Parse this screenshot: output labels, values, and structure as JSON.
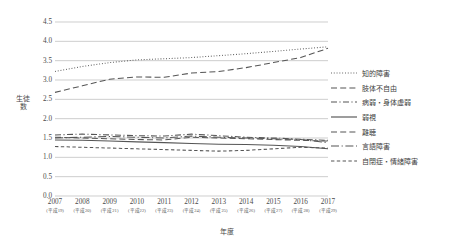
{
  "chart_data": {
    "type": "line",
    "title": "",
    "xlabel": "年度",
    "ylabel": "生徒数",
    "ylim": [
      0.0,
      4.5
    ],
    "ytick_step": 0.5,
    "grid": true,
    "legend_position": "right",
    "categories": [
      "2007",
      "2008",
      "2009",
      "2010",
      "2011",
      "2012",
      "2013",
      "2014",
      "2015",
      "2016",
      "2017"
    ],
    "category_sub": [
      "(平成19)",
      "(平成20)",
      "(平成21)",
      "(平成22)",
      "(平成23)",
      "(平成24)",
      "(平成25)",
      "(平成26)",
      "(平成27)",
      "(平成28)",
      "(平成29)"
    ],
    "yticks": [
      "0.0",
      "0.5",
      "1.0",
      "1.5",
      "2.0",
      "2.5",
      "3.0",
      "3.5",
      "4.0",
      "4.5"
    ],
    "series": [
      {
        "name": "知的障害",
        "dash": "dotted",
        "values": [
          3.22,
          3.35,
          3.45,
          3.52,
          3.55,
          3.58,
          3.63,
          3.68,
          3.74,
          3.8,
          3.86
        ]
      },
      {
        "name": "肢体不自由",
        "dash": "dashed",
        "values": [
          2.68,
          2.85,
          3.02,
          3.08,
          3.07,
          3.18,
          3.22,
          3.32,
          3.45,
          3.58,
          3.82
        ]
      },
      {
        "name": "病弱・身体虚弱",
        "dash": "dashdot",
        "values": [
          1.58,
          1.6,
          1.58,
          1.56,
          1.55,
          1.6,
          1.56,
          1.52,
          1.5,
          1.47,
          1.44
        ]
      },
      {
        "name": "弱視",
        "dash": "solid",
        "values": [
          1.45,
          1.44,
          1.42,
          1.4,
          1.38,
          1.36,
          1.34,
          1.33,
          1.31,
          1.28,
          1.22
        ]
      },
      {
        "name": "難聴",
        "dash": "dashed",
        "values": [
          1.52,
          1.5,
          1.48,
          1.46,
          1.45,
          1.52,
          1.5,
          1.48,
          1.46,
          1.44,
          1.42
        ]
      },
      {
        "name": "言語障害",
        "dash": "longdashdot",
        "values": [
          1.5,
          1.52,
          1.54,
          1.52,
          1.5,
          1.55,
          1.52,
          1.5,
          1.48,
          1.46,
          1.38
        ]
      },
      {
        "name": "自閉症・情緒障害",
        "dash": "shortdash",
        "values": [
          1.28,
          1.26,
          1.24,
          1.22,
          1.2,
          1.18,
          1.16,
          1.18,
          1.22,
          1.26,
          1.24
        ]
      }
    ]
  }
}
